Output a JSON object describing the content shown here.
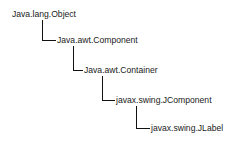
{
  "diagram": {
    "type": "class-hierarchy",
    "nodes": [
      {
        "label": "Java.lang.Object",
        "x": 12,
        "y": 9,
        "level": 0
      },
      {
        "label": "Java.awt.Component",
        "x": 57,
        "y": 35,
        "level": 1
      },
      {
        "label": "Java.awt.Container",
        "x": 84,
        "y": 65,
        "level": 2
      },
      {
        "label": "javax.swing.JComponent",
        "x": 116,
        "y": 95,
        "level": 3
      },
      {
        "label": "javax.swing.JLabel",
        "x": 151,
        "y": 123,
        "level": 4
      }
    ],
    "line_color": "#111111",
    "text_color": "#1a1a1a",
    "background": "#ffffff"
  }
}
